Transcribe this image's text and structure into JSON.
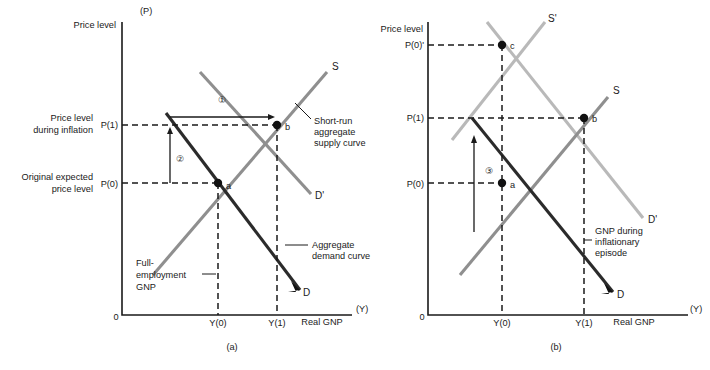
{
  "figure": {
    "panels": [
      {
        "id": "a",
        "caption": "(a)",
        "axes": {
          "y_axis_symbol": "(P)",
          "y_axis_label": "Price level",
          "x_axis_label": "Real GNP",
          "x_axis_symbol": "(Y)",
          "origin_label": "0"
        },
        "y_ticks": [
          {
            "key": "P1",
            "label": "P(1)",
            "desc_line1": "Price level",
            "desc_line2": "during inflation"
          },
          {
            "key": "P0",
            "label": "P(0)",
            "desc_line1": "Original expected",
            "desc_line2": "price level"
          }
        ],
        "x_ticks": [
          {
            "key": "Y0",
            "label": "Y(0)"
          },
          {
            "key": "Y1",
            "label": "Y(1)"
          }
        ],
        "curve_labels": [
          {
            "key": "S",
            "label": "S"
          },
          {
            "key": "Dprime",
            "label": "D'"
          },
          {
            "key": "D",
            "label": "D"
          }
        ],
        "points": [
          {
            "key": "a",
            "label": "a"
          },
          {
            "key": "b",
            "label": "b"
          }
        ],
        "annotations": [
          {
            "key": "step1",
            "label": "①"
          },
          {
            "key": "step2",
            "label": "②"
          }
        ],
        "callouts": [
          {
            "key": "sras",
            "lines": [
              "Short-run",
              "aggregate",
              "supply curve"
            ]
          },
          {
            "key": "ad",
            "lines": [
              "Aggregate",
              "demand curve"
            ]
          },
          {
            "key": "full-employment-gnp",
            "lines": [
              "Full-",
              "employment",
              "GNP"
            ]
          }
        ]
      },
      {
        "id": "b",
        "caption": "(b)",
        "axes": {
          "y_axis_label": "Price level",
          "x_axis_label": "Real GNP",
          "x_axis_symbol": "(Y)",
          "origin_label": "0"
        },
        "y_ticks": [
          {
            "key": "P0prime",
            "label": "P(0)'"
          },
          {
            "key": "P1",
            "label": "P(1)"
          },
          {
            "key": "P0",
            "label": "P(0)"
          }
        ],
        "x_ticks": [
          {
            "key": "Y0",
            "label": "Y(0)"
          },
          {
            "key": "Y1",
            "label": "Y(1)"
          }
        ],
        "curve_labels": [
          {
            "key": "Sprime",
            "label": "S'"
          },
          {
            "key": "S",
            "label": "S"
          },
          {
            "key": "Dprime",
            "label": "D'"
          },
          {
            "key": "D",
            "label": "D"
          }
        ],
        "points": [
          {
            "key": "a",
            "label": "a"
          },
          {
            "key": "b",
            "label": "b"
          },
          {
            "key": "c",
            "label": "c"
          }
        ],
        "annotations": [
          {
            "key": "step3",
            "label": "③"
          }
        ],
        "callouts": [
          {
            "key": "gnp-inflationary",
            "lines": [
              "GNP during",
              "inflationary",
              "episode"
            ]
          }
        ]
      }
    ],
    "colors": {
      "demand_dark": "#2b2b2b",
      "supply_gray": "#8f8f8f",
      "shifted_light": "#b9b9b9",
      "axis": "#1a1a1a",
      "background": "#ffffff"
    }
  }
}
